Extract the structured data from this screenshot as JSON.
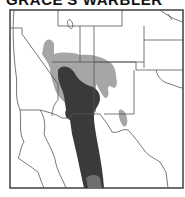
{
  "title": "GRACE'S WARBLER",
  "map": {
    "region": "Southwestern United States and northwestern Mexico",
    "legend_colors": {
      "breeding": "#a6a6a6",
      "year_round": "#3a3a3a",
      "border": "#555555",
      "frame": "#333333",
      "land": "#ffffff"
    }
  }
}
